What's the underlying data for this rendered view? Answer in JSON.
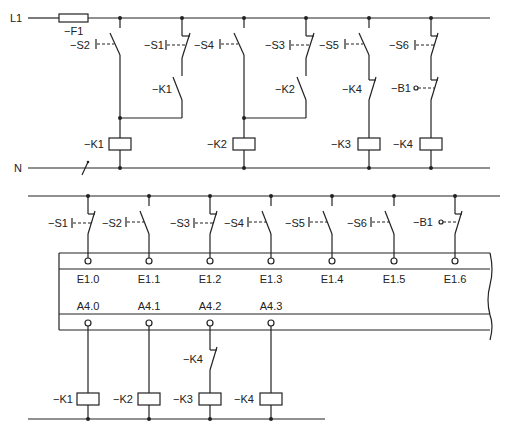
{
  "upper_circuit": {
    "rail_phase": "L1",
    "rail_neutral": "N",
    "fuse": "−F1",
    "labels": {
      "s2": "−S2",
      "s1": "−S1",
      "k1_hold": "−K1",
      "s4": "−S4",
      "s3": "−S3",
      "k2_hold": "−K2",
      "s5": "−S5",
      "k4_nc": "−K4",
      "s6": "−S6",
      "b1": "−B1",
      "coil_k1": "−K1",
      "coil_k2": "−K2",
      "coil_k3": "−K3",
      "coil_k4": "−K4"
    }
  },
  "plc_circuit": {
    "inputs": [
      {
        "switch": "−S1",
        "address": "E1.0",
        "type": "NC"
      },
      {
        "switch": "−S2",
        "address": "E1.1",
        "type": "NO"
      },
      {
        "switch": "−S3",
        "address": "E1.2",
        "type": "NC"
      },
      {
        "switch": "−S4",
        "address": "E1.3",
        "type": "NO"
      },
      {
        "switch": "−S5",
        "address": "E1.4",
        "type": "NO"
      },
      {
        "switch": "−S6",
        "address": "E1.5",
        "type": "NO"
      },
      {
        "switch": "−B1",
        "address": "E1.6",
        "type": "NC"
      }
    ],
    "outputs": [
      {
        "address": "A4.0",
        "coil": "−K1"
      },
      {
        "address": "A4.1",
        "coil": "−K2"
      },
      {
        "address": "A4.2",
        "coil": "−K3",
        "interlock": "−K4"
      },
      {
        "address": "A4.3",
        "coil": "−K4"
      }
    ]
  }
}
